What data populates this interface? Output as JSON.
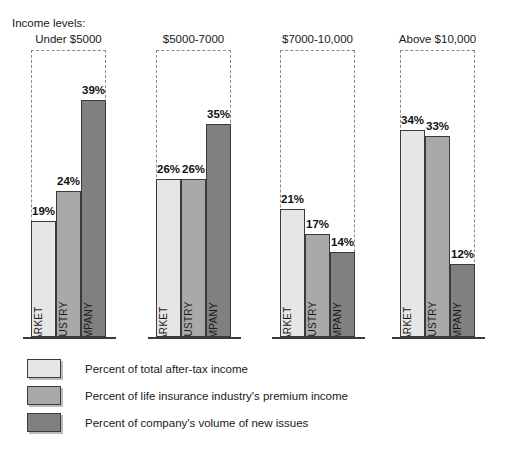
{
  "caption": "Income levels:",
  "chart_data": {
    "type": "bar",
    "title": "Income levels:",
    "xlabel": "",
    "ylabel": "",
    "ylim": [
      0,
      50
    ],
    "grid": false,
    "legend_position": "bottom-left",
    "categories": [
      "Under $5000",
      "$5000-7000",
      "$7000-10,000",
      "Above $10,000"
    ],
    "series": [
      {
        "name": "MARKET",
        "legend": "Percent of total after-tax income",
        "color": "#e6e6e6",
        "values": [
          19,
          26,
          21,
          34
        ],
        "value_labels": [
          "19%",
          "26%",
          "21%",
          "34%"
        ]
      },
      {
        "name": "INDUSTRY",
        "legend": "Percent of life insurance industry's premium income",
        "color": "#a9a9a9",
        "values": [
          24,
          26,
          17,
          33
        ],
        "value_labels": [
          "24%",
          "26%",
          "17%",
          "33%"
        ]
      },
      {
        "name": "COMPANY",
        "legend": "Percent of company's volume of new issues",
        "color": "#808080",
        "values": [
          39,
          35,
          14,
          12
        ],
        "value_labels": [
          "39%",
          "35%",
          "14%",
          "12%"
        ]
      }
    ]
  },
  "groups": [
    {
      "title": "Under $5000",
      "bars": [
        {
          "label": "MARKET",
          "value_label": "19%"
        },
        {
          "label": "INDUSTRY",
          "value_label": "24%"
        },
        {
          "label": "COMPANY",
          "value_label": "39%"
        }
      ]
    },
    {
      "title": "$5000-7000",
      "bars": [
        {
          "label": "MARKET",
          "value_label": "26%"
        },
        {
          "label": "INDUSTRY",
          "value_label": "26%"
        },
        {
          "label": "COMPANY",
          "value_label": "35%"
        }
      ]
    },
    {
      "title": "$7000-10,000",
      "bars": [
        {
          "label": "MARKET",
          "value_label": "21%"
        },
        {
          "label": "INDUSTRY",
          "value_label": "17%"
        },
        {
          "label": "COMPANY",
          "value_label": "14%"
        }
      ]
    },
    {
      "title": "Above $10,000",
      "bars": [
        {
          "label": "MARKET",
          "value_label": "34%"
        },
        {
          "label": "INDUSTRY",
          "value_label": "33%"
        },
        {
          "label": "COMPANY",
          "value_label": "12%"
        }
      ]
    }
  ],
  "legend": {
    "items": [
      {
        "swatch": "light-gray-swatch",
        "label": "Percent of total after-tax income"
      },
      {
        "swatch": "medium-gray-swatch",
        "label": "Percent of life insurance industry's premium income"
      },
      {
        "swatch": "dark-gray-swatch",
        "label": "Percent of company's volume of new issues"
      }
    ]
  }
}
